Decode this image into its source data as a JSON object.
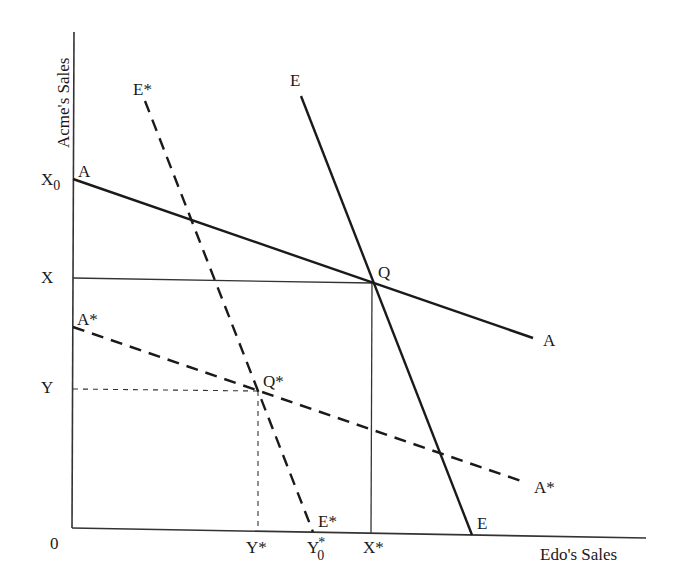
{
  "diagram": {
    "type": "reaction-function-diagram",
    "axes": {
      "y_title": "Acme's Sales",
      "x_title": "Edo's Sales",
      "origin_label": "0"
    },
    "y_ticks": {
      "x0": {
        "base": "X",
        "sub": "0"
      },
      "x": "X",
      "y": "Y"
    },
    "x_ticks": {
      "y_star": "Y*",
      "y0_star": {
        "base": "Y",
        "sup": "*",
        "sub": "0"
      },
      "x_star": "X*"
    },
    "curves": [
      {
        "id": "A",
        "style": "solid",
        "label_start": "A",
        "label_end": "A",
        "from": [
          73,
          179
        ],
        "to": [
          533,
          338
        ]
      },
      {
        "id": "E",
        "style": "solid",
        "label_start": "E",
        "label_end": "E",
        "from": [
          301,
          96
        ],
        "to": [
          472,
          535
        ]
      },
      {
        "id": "A*",
        "style": "dashed",
        "label_start": "A*",
        "label_end": "A*",
        "from": [
          73,
          327
        ],
        "to": [
          524,
          482
        ]
      },
      {
        "id": "E*",
        "style": "dashed",
        "label_start": "E*",
        "label_end": "E*",
        "from": [
          145,
          101
        ],
        "to": [
          313,
          532
        ]
      }
    ],
    "points": {
      "q": "Q",
      "q_star": "Q*"
    }
  }
}
